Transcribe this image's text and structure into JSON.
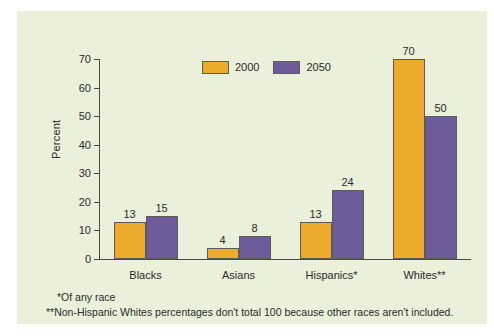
{
  "chart_data": {
    "type": "bar",
    "title": "",
    "xlabel": "",
    "ylabel": "Percent",
    "ylim": [
      0,
      70
    ],
    "yticks": [
      0,
      10,
      20,
      30,
      40,
      50,
      60,
      70
    ],
    "ytick_labels": [
      "0",
      "10",
      "20",
      "30",
      "40",
      "50",
      "60",
      "70"
    ],
    "grid": false,
    "legend_position": "top-center",
    "categories": [
      "Blacks",
      "Asians",
      "Hispanics*",
      "Whites**"
    ],
    "series": [
      {
        "name": "2000",
        "color": "#edab2d",
        "values": [
          13,
          4,
          13,
          70
        ]
      },
      {
        "name": "2050",
        "color": "#6f5b9a",
        "values": [
          15,
          8,
          24,
          50
        ]
      }
    ],
    "annotations": [
      "*Of any race",
      "**Non-Hispanic Whites percentages don't total 100 because other races aren't included."
    ]
  },
  "legend": {
    "items": [
      {
        "label": "2000",
        "color": "#edab2d"
      },
      {
        "label": "2050",
        "color": "#6f5b9a"
      }
    ]
  },
  "footnotes": {
    "one": "*Of any race",
    "two": "**Non-Hispanic Whites percentages don't total 100 because other races aren't included."
  },
  "colors": {
    "panel_background": "#eaf0da",
    "page_background": "#ffffff",
    "axis": "#4a4a4a",
    "text": "#2b2b2b",
    "series_2000": "#edab2d",
    "series_2050": "#6f5b9a"
  }
}
